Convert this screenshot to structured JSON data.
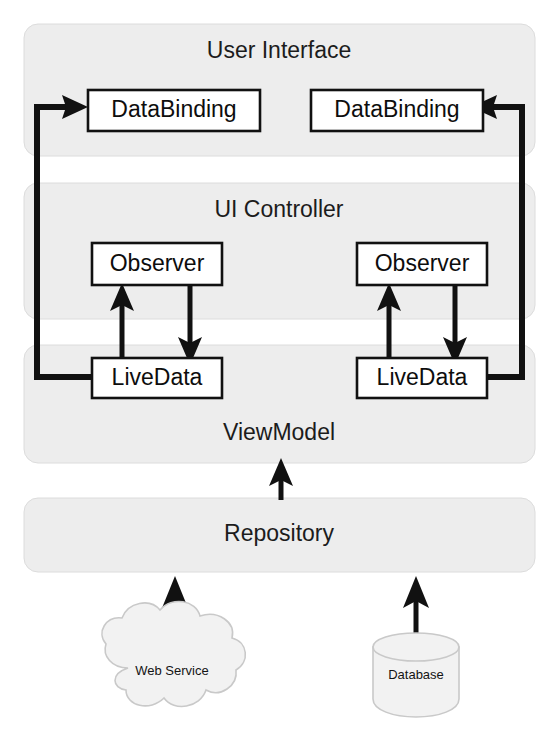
{
  "diagram": {
    "type": "layered-architecture-diagram",
    "layers": [
      {
        "id": "user-interface",
        "label": "User Interface"
      },
      {
        "id": "ui-controller",
        "label": "UI Controller"
      },
      {
        "id": "viewmodel",
        "label": "ViewModel"
      },
      {
        "id": "repository",
        "label": "Repository"
      }
    ],
    "nodes": {
      "databinding_left": "DataBinding",
      "databinding_right": "DataBinding",
      "observer_left": "Observer",
      "observer_right": "Observer",
      "livedata_left": "LiveData",
      "livedata_right": "LiveData"
    },
    "sources": {
      "web_service": "Web Service",
      "database": "Database"
    },
    "colors": {
      "band_fill": "#ededed",
      "band_stroke": "#dcdcdc",
      "node_fill": "#ffffff",
      "node_stroke": "#111111",
      "arrow": "#111111",
      "source_fill": "#f2f2f2",
      "source_stroke": "#c9c9c9",
      "background": "#ffffff"
    },
    "connections": [
      {
        "from": "livedata_left",
        "to": "databinding_left",
        "style": "thick-routed-left"
      },
      {
        "from": "livedata_right",
        "to": "databinding_right",
        "style": "thick-routed-right"
      },
      {
        "from": "livedata_left",
        "to": "observer_left",
        "style": "vertical-up"
      },
      {
        "from": "observer_left",
        "to": "livedata_left",
        "style": "vertical-down"
      },
      {
        "from": "livedata_right",
        "to": "observer_right",
        "style": "vertical-up"
      },
      {
        "from": "observer_right",
        "to": "livedata_right",
        "style": "vertical-down"
      },
      {
        "from": "repository",
        "to": "viewmodel",
        "style": "vertical-up"
      },
      {
        "from": "web_service",
        "to": "repository",
        "style": "vertical-up"
      },
      {
        "from": "database",
        "to": "repository",
        "style": "vertical-up"
      }
    ]
  }
}
